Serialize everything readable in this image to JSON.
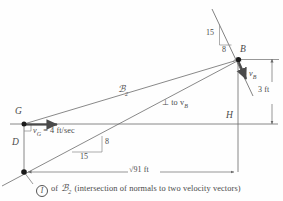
{
  "figure": {
    "background_color": "#fefefe",
    "line_color": "#6b6b6b",
    "text_color": "#4a4a4a",
    "point_color": "#1a1a1a"
  },
  "points": {
    "B": "B",
    "G": "G",
    "D": "D",
    "H": "H"
  },
  "labels": {
    "body_line": "ℬ",
    "body_line_sub": "2",
    "slope_top_rise": "15",
    "slope_top_run": "8",
    "slope_bottom_rise": "8",
    "slope_bottom_run": "15",
    "velocity_g": "v",
    "velocity_g_sub": "G",
    "velocity_g_value": "= 4 ft/sec",
    "velocity_b": "v",
    "velocity_b_sub": "B",
    "perp_label": "⊥ to v",
    "perp_label_sub": "B",
    "dim_vertical": "3 ft",
    "dim_horizontal": "√91 ft"
  },
  "caption": {
    "marker": "I",
    "text_before": "of",
    "symbol": "ℬ",
    "symbol_sub": "2",
    "text_after": "(intersection of normals to two velocity vectors)"
  }
}
